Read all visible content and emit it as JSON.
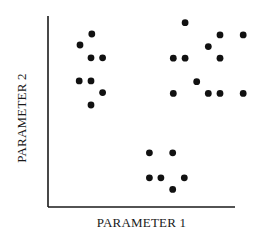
{
  "chart_data": {
    "type": "scatter",
    "title": "",
    "xlabel": "PARAMETER 1",
    "ylabel": "PARAMETER 2",
    "xlim": [
      0,
      10
    ],
    "ylim": [
      0,
      10
    ],
    "grid": false,
    "ticks": false,
    "legend": null,
    "colors": {
      "dots": "#111111",
      "axes": "#1a1a1a",
      "background": "#ffffff"
    },
    "series": [
      {
        "name": "cluster-upper-left",
        "points": [
          [
            2.34,
            9.06
          ],
          [
            1.71,
            8.48
          ],
          [
            2.3,
            7.81
          ],
          [
            2.92,
            7.81
          ],
          [
            1.67,
            6.6
          ],
          [
            2.3,
            6.6
          ],
          [
            2.92,
            5.99
          ],
          [
            2.3,
            5.34
          ]
        ]
      },
      {
        "name": "cluster-upper-right",
        "points": [
          [
            7.33,
            9.65
          ],
          [
            9.2,
            9.01
          ],
          [
            10.44,
            9.01
          ],
          [
            8.57,
            8.4
          ],
          [
            6.7,
            7.79
          ],
          [
            7.33,
            7.79
          ],
          [
            9.2,
            7.79
          ],
          [
            7.95,
            6.56
          ],
          [
            6.7,
            5.95
          ],
          [
            8.57,
            5.95
          ],
          [
            9.2,
            5.95
          ],
          [
            10.44,
            5.95
          ]
        ]
      },
      {
        "name": "cluster-lower-middle",
        "points": [
          [
            5.42,
            2.84
          ],
          [
            6.67,
            2.84
          ],
          [
            5.42,
            1.53
          ],
          [
            6.04,
            1.53
          ],
          [
            7.29,
            1.53
          ],
          [
            6.67,
            0.92
          ]
        ]
      }
    ]
  },
  "layout": {
    "origin_px": [
      48,
      207
    ],
    "x_axis_end_px": 235,
    "y_axis_top_px": 16,
    "dot_radius_px": 3.4
  }
}
